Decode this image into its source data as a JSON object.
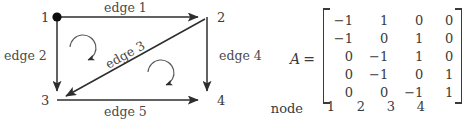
{
  "figure": {
    "caption_text": "",
    "stroke_color": "#3a3a3a",
    "background_color": "#ffffff"
  },
  "graph": {
    "nodes": [
      {
        "id": "1",
        "label": "1",
        "x": 57,
        "y": 17,
        "filled": true
      },
      {
        "id": "2",
        "label": "2",
        "x": 207,
        "y": 17,
        "filled": false
      },
      {
        "id": "3",
        "label": "3",
        "x": 57,
        "y": 100,
        "filled": false
      },
      {
        "id": "4",
        "label": "4",
        "x": 207,
        "y": 100,
        "filled": false
      }
    ],
    "edges": [
      {
        "id": "edge1",
        "label": "edge 1",
        "from": "1",
        "to": "2",
        "direction": "right"
      },
      {
        "id": "edge2",
        "label": "edge 2",
        "from": "1",
        "to": "3",
        "direction": "down"
      },
      {
        "id": "edge3",
        "label": "edge 3",
        "from": "2",
        "to": "3",
        "direction": "diagonal-down-left"
      },
      {
        "id": "edge4",
        "label": "edge 4",
        "from": "2",
        "to": "4",
        "direction": "down"
      },
      {
        "id": "edge5",
        "label": "edge 5",
        "from": "3",
        "to": "4",
        "direction": "right"
      }
    ],
    "loop_arrows": [
      {
        "id": "loop-upper",
        "rotation": "clockwise"
      },
      {
        "id": "loop-lower",
        "rotation": "clockwise"
      }
    ]
  },
  "matrix": {
    "name": "A",
    "equals": "=",
    "rows": [
      [
        "−1",
        "1",
        "0",
        "0"
      ],
      [
        "−1",
        "0",
        "1",
        "0"
      ],
      [
        "0",
        "−1",
        "1",
        "0"
      ],
      [
        "0",
        "−1",
        "0",
        "1"
      ],
      [
        "0",
        "0",
        "−1",
        "1"
      ]
    ],
    "column_axis_label": "node",
    "column_headers": [
      "1",
      "2",
      "3",
      "4"
    ]
  }
}
